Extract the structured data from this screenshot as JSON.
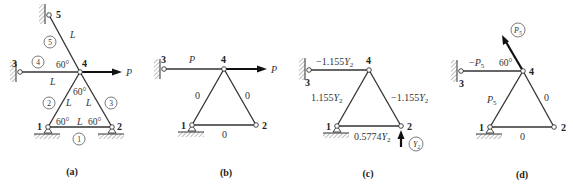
{
  "panels": {
    "a": {
      "caption": "(a)",
      "nodes": {
        "n1": "1",
        "n2": "2",
        "n3": "3",
        "n4": "4",
        "n5": "5"
      },
      "member_numbers": {
        "m1": "1",
        "m2": "2",
        "m3": "3",
        "m4": "4",
        "m5": "5"
      },
      "length_label": "L",
      "angle_label": "60°",
      "load_label": "P"
    },
    "b": {
      "caption": "(b)",
      "nodes": {
        "n1": "1",
        "n2": "2",
        "n3": "3",
        "n4": "4"
      },
      "forces": {
        "m34": "P",
        "m14": "0",
        "m24": "0",
        "m12": "0"
      },
      "load_label": "P"
    },
    "c": {
      "caption": "(c)",
      "nodes": {
        "n1": "1",
        "n2": "2",
        "n3": "3",
        "n4": "4"
      },
      "forces": {
        "m34_coef": "−1.155",
        "m14_coef": "1.155",
        "m24_coef": "−1.155",
        "m12_coef": "0.5774"
      },
      "force_symbol": "Y",
      "force_subscript": "2",
      "redundant_label": "Y",
      "redundant_subscript": "2"
    },
    "d": {
      "caption": "(d)",
      "nodes": {
        "n1": "1",
        "n2": "2",
        "n3": "3",
        "n4": "4"
      },
      "forces": {
        "m34_prefix": "−",
        "m14_prefix": "",
        "m24": "0",
        "m12": "0"
      },
      "force_symbol": "P",
      "force_subscript": "5",
      "angle_label": "60°",
      "redundant_label": "P",
      "redundant_subscript": "5"
    }
  }
}
